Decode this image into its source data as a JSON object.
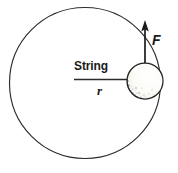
{
  "figure": {
    "background_color": "#ffffff",
    "ink_color": "#1a1a1a",
    "width": 178,
    "height": 173,
    "labels": {
      "string": "String",
      "radius": "r",
      "force": "F"
    },
    "elements": {
      "orbit_circle_name": "circular-path",
      "ball_name": "ball",
      "string_line_name": "string-line",
      "force_arrow_name": "force-arrow"
    },
    "geometry": {
      "orbit_center_x": 85,
      "orbit_center_y": 83,
      "orbit_radius": 75,
      "ball_center_x": 145,
      "ball_center_y": 81,
      "ball_radius": 18,
      "string_start_x": 74,
      "string_end_x": 145,
      "string_y": 80,
      "arrow_tip_y": 21,
      "arrow_base_y": 63,
      "arrow_x": 145
    },
    "colors": {
      "outline": "#2b2b2b",
      "ball_fill": "#fdfdfb",
      "ball_shadow": "#171717",
      "ball_stipple": "#8d8d8d"
    }
  }
}
